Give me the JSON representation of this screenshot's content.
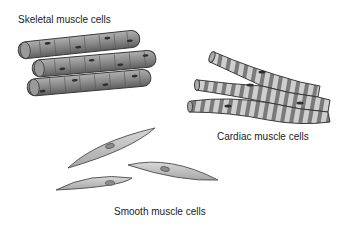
{
  "labels": {
    "skeletal": "Skeletal muscle cells",
    "cardiac": "Cardiac muscle cells",
    "smooth": "Smooth muscle cells"
  },
  "colors": {
    "background": "#ffffff",
    "skeletal_fill": "#8a8a8a",
    "skeletal_dark": "#555555",
    "cardiac_light": "#c8c8c8",
    "cardiac_band": "#7a7a7a",
    "smooth_fill": "#bdbdbd",
    "outline": "#3a3a3a",
    "text": "#222222"
  }
}
